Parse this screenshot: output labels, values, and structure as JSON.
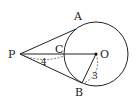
{
  "diagram": {
    "type": "geometry",
    "points": {
      "P": {
        "label": "P"
      },
      "A": {
        "label": "A"
      },
      "B": {
        "label": "B"
      },
      "C": {
        "label": "C"
      },
      "O": {
        "label": "O"
      }
    },
    "measurements": {
      "PC": "4",
      "OB": "3"
    },
    "colors": {
      "stroke": "#222222",
      "background": "#ffffff"
    }
  }
}
